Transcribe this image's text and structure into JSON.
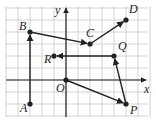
{
  "diagram": {
    "type": "coordinate-grid-vectors",
    "axes": {
      "x_label": "x",
      "y_label": "y",
      "origin_label": "O"
    },
    "grid": {
      "x_range": [
        -5,
        7
      ],
      "y_range": [
        -3,
        6
      ],
      "unit_px": 12
    },
    "points": [
      {
        "label": "A",
        "x": -3,
        "y": -2
      },
      {
        "label": "B",
        "x": -3,
        "y": 4
      },
      {
        "label": "C",
        "x": 2,
        "y": 3
      },
      {
        "label": "D",
        "x": 5,
        "y": 5
      },
      {
        "label": "O",
        "x": 0,
        "y": 0
      },
      {
        "label": "P",
        "x": 5,
        "y": -2
      },
      {
        "label": "Q",
        "x": 4,
        "y": 2
      },
      {
        "label": "R",
        "x": -1,
        "y": 2
      }
    ],
    "vectors": [
      {
        "from": "A",
        "to": "B"
      },
      {
        "from": "B",
        "to": "C"
      },
      {
        "from": "C",
        "to": "D"
      },
      {
        "from": "O",
        "to": "P"
      },
      {
        "from": "P",
        "to": "Q"
      },
      {
        "from": "Q",
        "to": "R"
      }
    ],
    "colors": {
      "grid": "#c8c8c8",
      "ink": "#222222"
    }
  }
}
